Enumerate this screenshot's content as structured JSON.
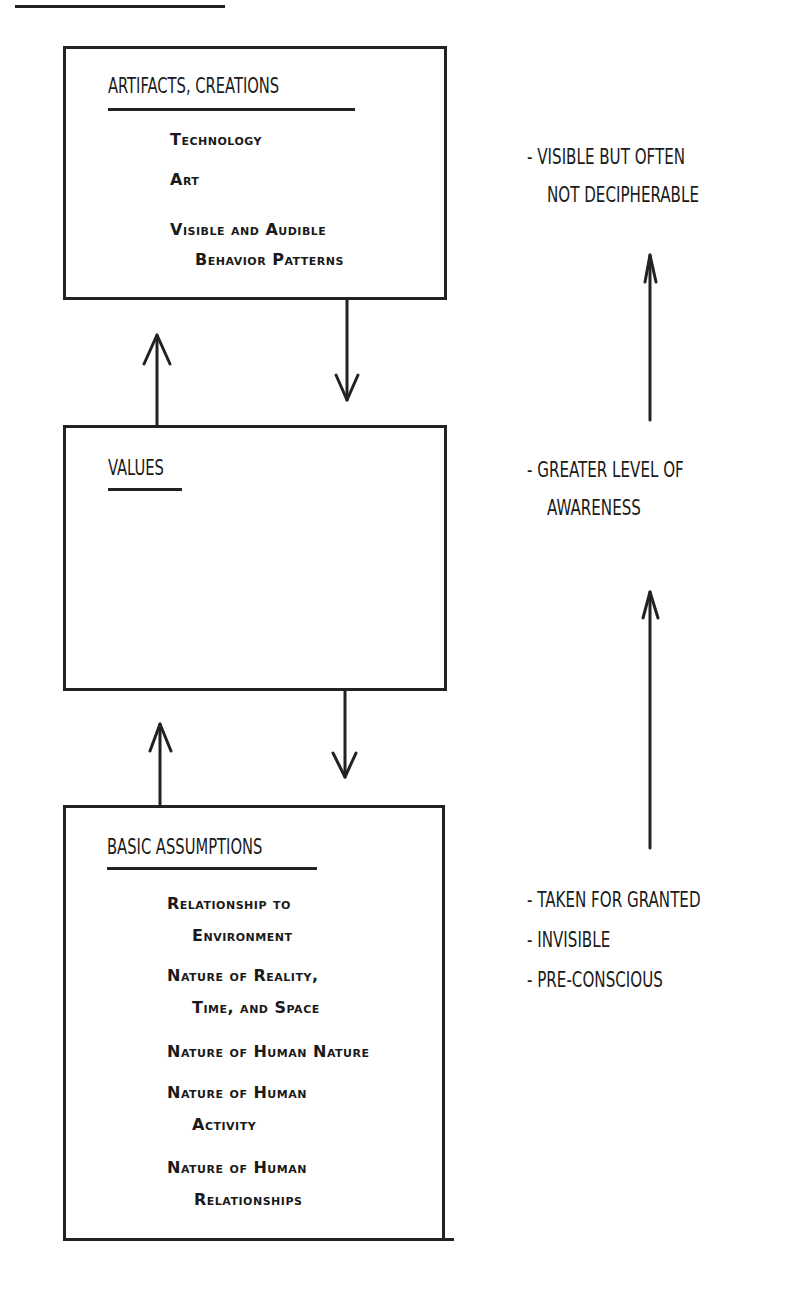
{
  "levels": [
    {
      "title": "ARTIFACTS, CREATIONS",
      "items": [
        {
          "line1": "Technology",
          "line2": ""
        },
        {
          "line1": "Art",
          "line2": ""
        },
        {
          "line1": "Visible and Audible",
          "line2": "Behavior Patterns"
        }
      ],
      "note": [
        "- VISIBLE BUT OFTEN",
        "NOT DECIPHERABLE"
      ]
    },
    {
      "title": "VALUES",
      "items": [],
      "note": [
        "- GREATER LEVEL OF",
        "AWARENESS"
      ]
    },
    {
      "title": "BASIC ASSUMPTIONS",
      "items": [
        {
          "line1": "Relationship to",
          "line2": "Environment"
        },
        {
          "line1": "Nature of Reality,",
          "line2": "Time, and Space"
        },
        {
          "line1": "Nature of Human Nature",
          "line2": ""
        },
        {
          "line1": "Nature of Human",
          "line2": "Activity"
        },
        {
          "line1": "Nature of Human",
          "line2": "Relationships"
        }
      ],
      "note": [
        "- TAKEN FOR GRANTED",
        "- INVISIBLE",
        "- PRE-CONSCIOUS"
      ]
    }
  ],
  "connectors": [
    {
      "from": "VALUES",
      "to": "ARTIFACTS, CREATIONS",
      "direction": "up"
    },
    {
      "from": "ARTIFACTS, CREATIONS",
      "to": "VALUES",
      "direction": "down"
    },
    {
      "from": "BASIC ASSUMPTIONS",
      "to": "VALUES",
      "direction": "up"
    },
    {
      "from": "VALUES",
      "to": "BASIC ASSUMPTIONS",
      "direction": "down"
    }
  ],
  "awareness_axis": {
    "direction": "up",
    "segments": 2
  },
  "colors": {
    "ink": "#222222",
    "paper": "#ffffff"
  }
}
